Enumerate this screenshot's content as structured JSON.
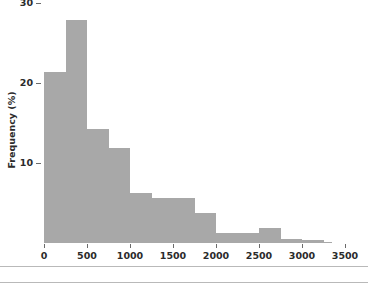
{
  "chart_data": {
    "type": "bar",
    "title": "",
    "subtitle": "",
    "xlabel": "",
    "ylabel": "Frequency (%)",
    "xlim": [
      0,
      3500
    ],
    "ylim": [
      0,
      31
    ],
    "grid": false,
    "legend": null,
    "bar_color": "#a8a8a8",
    "bin_width": 250,
    "note": "Right-skewed histogram of frequency percentages versus value; bins of width 250 from 0 to 3250, plus a thin sliver to 3500.",
    "x_ticks": [
      0,
      500,
      1000,
      1500,
      2000,
      2500,
      3000,
      3500
    ],
    "x_tick_labels": [
      "0",
      "500",
      "1000",
      "1500",
      "2000",
      "2500",
      "3000",
      "3500"
    ],
    "y_ticks": [
      10,
      20,
      30
    ],
    "y_tick_labels": [
      "10",
      "20",
      "30"
    ],
    "bins": [
      {
        "left": 0,
        "right": 250,
        "value": 21.4
      },
      {
        "left": 250,
        "right": 500,
        "value": 27.9
      },
      {
        "left": 500,
        "right": 750,
        "value": 14.3
      },
      {
        "left": 750,
        "right": 1000,
        "value": 11.9
      },
      {
        "left": 1000,
        "right": 1250,
        "value": 6.2
      },
      {
        "left": 1250,
        "right": 1500,
        "value": 5.6
      },
      {
        "left": 1500,
        "right": 1750,
        "value": 5.6
      },
      {
        "left": 1750,
        "right": 2000,
        "value": 3.7
      },
      {
        "left": 2000,
        "right": 2250,
        "value": 1.3
      },
      {
        "left": 2250,
        "right": 2500,
        "value": 1.3
      },
      {
        "left": 2500,
        "right": 2750,
        "value": 1.9
      },
      {
        "left": 2750,
        "right": 3000,
        "value": 0.5
      },
      {
        "left": 3000,
        "right": 3250,
        "value": 0.4
      },
      {
        "left": 3250,
        "right": 3350,
        "value": 0.12
      }
    ],
    "categories": [
      "0-250",
      "250-500",
      "500-750",
      "750-1000",
      "1000-1250",
      "1250-1500",
      "1500-1750",
      "1750-2000",
      "2000-2250",
      "2250-2500",
      "2500-2750",
      "2750-3000",
      "3000-3250",
      "3250-3350"
    ],
    "values": [
      21.4,
      27.9,
      14.3,
      11.9,
      6.2,
      5.6,
      5.6,
      3.7,
      1.3,
      1.3,
      1.9,
      0.5,
      0.4,
      0.12
    ]
  }
}
